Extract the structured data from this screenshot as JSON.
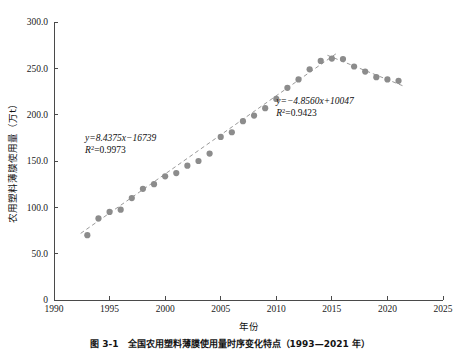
{
  "figure": {
    "caption": "图 3-1　全国农用塑料薄膜使用量时序变化特点（1993—2021 年）"
  },
  "chart_data": {
    "type": "scatter",
    "title": "",
    "xlabel": "年份",
    "ylabel": "农用塑料薄膜使用量（万t）",
    "xlim": [
      1990,
      2025
    ],
    "ylim": [
      0,
      300
    ],
    "xticks": [
      1990,
      1995,
      2000,
      2005,
      2010,
      2015,
      2020,
      2025
    ],
    "xtick_labels": [
      "1990",
      "1995",
      "2000",
      "2005",
      "2010",
      "2015",
      "2020",
      "2025"
    ],
    "yticks": [
      0,
      50,
      100,
      150,
      200,
      250,
      300
    ],
    "ytick_labels": [
      "0",
      "50.0",
      "100.0",
      "150.0",
      "200.0",
      "250.0",
      "300.0"
    ],
    "grid": false,
    "legend": false,
    "marker_color": "#8c8c8c",
    "trend_color": "#9a9a9a",
    "x": [
      1993,
      1994,
      1995,
      1996,
      1997,
      1998,
      1999,
      2000,
      2001,
      2002,
      2003,
      2004,
      2005,
      2006,
      2007,
      2008,
      2009,
      2010,
      2011,
      2012,
      2013,
      2014,
      2015,
      2016,
      2017,
      2018,
      2019,
      2020,
      2021
    ],
    "values": [
      70.0,
      88.0,
      95.0,
      97.5,
      110.0,
      120.0,
      125.0,
      133.5,
      137.0,
      145.0,
      150.0,
      158.0,
      176.0,
      181.0,
      193.0,
      199.0,
      207.0,
      217.0,
      229.0,
      238.0,
      249.0,
      258.0,
      260.5,
      260.0,
      252.0,
      246.5,
      240.5,
      238.0,
      236.5
    ],
    "annotations": [
      {
        "name": "rising-trend-equation",
        "equation": "y=8.4375x−16739",
        "r_squared_label": "R",
        "r_squared_exp": "2",
        "r_squared_value": "=0.9973",
        "x": 1992.8,
        "y": 172
      },
      {
        "name": "declining-trend-equation",
        "equation": "y=−4.8560x+10047",
        "r_squared_label": "R",
        "r_squared_exp": "2",
        "r_squared_value": "=0.9423",
        "x": 2010.0,
        "y": 212
      }
    ],
    "trendlines": [
      {
        "name": "rising",
        "slope": 8.4375,
        "intercept": -16739,
        "x_start": 1992.4,
        "x_end": 2015.4
      },
      {
        "name": "declining",
        "slope": -4.856,
        "intercept": 10047,
        "x_start": 2014.6,
        "x_end": 2021.6
      }
    ]
  }
}
